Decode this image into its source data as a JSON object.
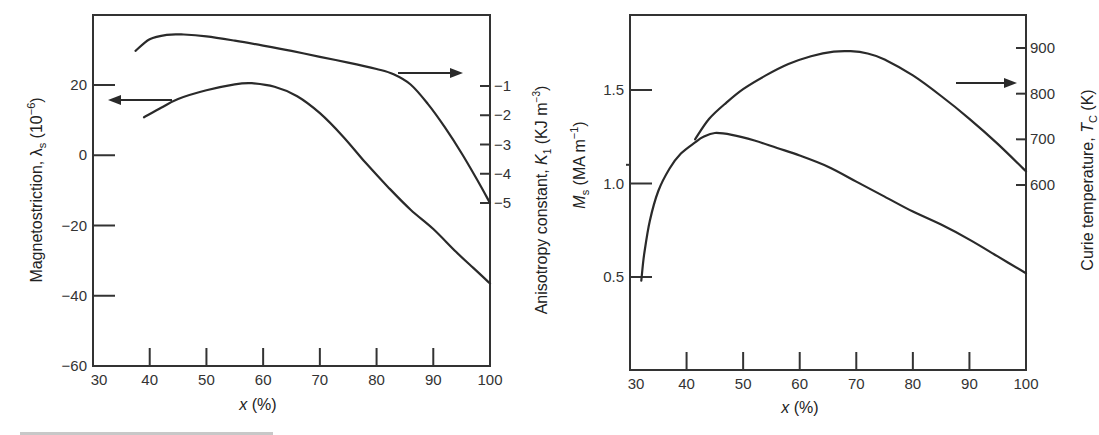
{
  "chart_data": [
    {
      "type": "line",
      "panel": "left",
      "title": "",
      "xlabel": "x (%)",
      "ylabel_left": "Magnetostriction, λs (10^-6)",
      "ylabel_right": "Anisotropy constant, K1 (KJ m^-3)",
      "xlim": [
        30,
        100
      ],
      "ylim_left": [
        -60,
        36
      ],
      "x_ticks": [
        30,
        40,
        50,
        60,
        70,
        80,
        90,
        100
      ],
      "y_ticks_left": [
        20,
        0,
        -20,
        -40,
        -60
      ],
      "y_ticks_right": [
        -1,
        -2,
        -3,
        -4,
        -5
      ],
      "grid": false,
      "series": [
        {
          "name": "Anisotropy constant K1",
          "axis": "right",
          "x": [
            37.5,
            40,
            43,
            46,
            50,
            55,
            60,
            65,
            70,
            75,
            80,
            83,
            86,
            89,
            92,
            95,
            98,
            100
          ],
          "values": [
            0.2,
            0.6,
            0.75,
            0.76,
            0.7,
            0.55,
            0.38,
            0.2,
            0.0,
            -0.2,
            -0.42,
            -0.6,
            -0.95,
            -1.6,
            -2.4,
            -3.3,
            -4.3,
            -5.0
          ]
        },
        {
          "name": "Magnetostriction λs",
          "axis": "left",
          "x": [
            39,
            42,
            45,
            50,
            55,
            58,
            62,
            66,
            70,
            74,
            78,
            82,
            86,
            90,
            94,
            97,
            100
          ],
          "values": [
            10.8,
            13.5,
            16,
            18.5,
            20.2,
            20.5,
            19.5,
            16.8,
            12,
            5.5,
            -2,
            -9,
            -15.5,
            -21,
            -27.5,
            -32,
            -36.5
          ]
        }
      ],
      "arrows": [
        {
          "direction": "left",
          "points_to": "left axis",
          "series": "Magnetostriction λs"
        },
        {
          "direction": "right",
          "points_to": "right axis",
          "series": "Anisotropy constant K1"
        }
      ]
    },
    {
      "type": "line",
      "panel": "right",
      "title": "",
      "xlabel": "x (%)",
      "ylabel_left": "Ms (MA m^-1)",
      "ylabel_right": "Curie temperature, TC (K)",
      "xlim": [
        30,
        100
      ],
      "ylim_left": [
        0.2,
        1.9
      ],
      "ylim_right": [
        300,
        1000
      ],
      "x_ticks": [
        30,
        40,
        50,
        60,
        70,
        80,
        90,
        100
      ],
      "y_ticks_left": [
        1.5,
        1.0,
        0.5
      ],
      "y_ticks_right": [
        900,
        800,
        700,
        600
      ],
      "grid": false,
      "series": [
        {
          "name": "Saturation magnetization Ms",
          "axis": "left",
          "x": [
            32,
            32.5,
            33.5,
            35,
            37,
            39,
            41.5,
            43,
            45,
            48,
            52,
            56,
            60,
            65,
            70,
            75,
            80,
            85,
            90,
            95,
            100
          ],
          "values": [
            0.48,
            0.62,
            0.8,
            0.96,
            1.08,
            1.16,
            1.22,
            1.25,
            1.27,
            1.26,
            1.23,
            1.19,
            1.15,
            1.09,
            1.01,
            0.93,
            0.85,
            0.78,
            0.7,
            0.61,
            0.52
          ]
        },
        {
          "name": "Curie temperature TC",
          "axis": "right",
          "x": [
            41.5,
            44,
            47,
            50,
            54,
            58,
            62,
            66,
            69,
            72,
            75,
            80,
            85,
            90,
            95,
            100
          ],
          "values": [
            700,
            745,
            780,
            810,
            840,
            865,
            882,
            892,
            893,
            888,
            875,
            840,
            795,
            745,
            690,
            630
          ]
        }
      ],
      "arrows": [
        {
          "direction": "right",
          "points_to": "right axis",
          "series": "Curie temperature TC"
        }
      ]
    }
  ],
  "labels": {
    "left": {
      "xlabel_var": "x",
      "xlabel_unit": " (%)",
      "ylabel_left_main": "Magnetostriction, λ",
      "ylabel_left_sub": "s",
      "ylabel_left_unit": " (10",
      "ylabel_left_exp": "−6",
      "ylabel_left_close": ")",
      "ylabel_right_main": "Anisotropy constant, ",
      "ylabel_right_var": "K",
      "ylabel_right_sub": "1",
      "ylabel_right_unit": " (KJ m",
      "ylabel_right_exp": "−3",
      "ylabel_right_close": ")",
      "x_tick_labels": [
        "30",
        "40",
        "50",
        "60",
        "70",
        "80",
        "90",
        "100"
      ],
      "y_left_tick_labels": [
        "20",
        "0",
        "−20",
        "−40",
        "−60"
      ],
      "y_right_tick_labels": [
        "−1",
        "−2",
        "−3",
        "−4",
        "−5"
      ]
    },
    "right": {
      "xlabel_var": "x",
      "xlabel_unit": " (%)",
      "ylabel_left_var": "M",
      "ylabel_left_sub": "s",
      "ylabel_left_unit": " (MA m",
      "ylabel_left_exp": "−1",
      "ylabel_left_close": ")",
      "ylabel_right_main": "Curie temperature, ",
      "ylabel_right_var": "T",
      "ylabel_right_sub": "C",
      "ylabel_right_unit": " (K)",
      "x_tick_labels": [
        "30",
        "40",
        "50",
        "60",
        "70",
        "80",
        "90",
        "100"
      ],
      "y_left_tick_labels": [
        "1.5",
        "1.0",
        "0.5"
      ],
      "y_right_tick_labels": [
        "900",
        "800",
        "700",
        "600"
      ]
    }
  }
}
